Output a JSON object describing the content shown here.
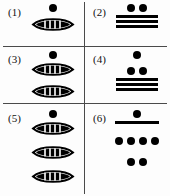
{
  "figure": {
    "background_color": "#fdfdfd",
    "ink_color": "#000000",
    "divider_color": "#4a4a4a",
    "layout": "2 columns x 3 rows grid of labeled Mayan numeral figures"
  },
  "cells": [
    {
      "label": "(1)",
      "name": "cell-1",
      "rows": [
        {
          "type": "dots",
          "count": 1
        },
        {
          "type": "shell",
          "count": 1
        }
      ]
    },
    {
      "label": "(2)",
      "name": "cell-2",
      "rows": [
        {
          "type": "dots",
          "count": 2
        },
        {
          "type": "bars",
          "count": 3
        }
      ]
    },
    {
      "label": "(3)",
      "name": "cell-3",
      "rows": [
        {
          "type": "dots",
          "count": 1
        },
        {
          "type": "shell",
          "count": 1
        },
        {
          "type": "shell",
          "count": 1
        }
      ]
    },
    {
      "label": "(4)",
      "name": "cell-4",
      "rows": [
        {
          "type": "dots",
          "count": 1
        },
        {
          "type": "dots",
          "count": 2
        },
        {
          "type": "bars",
          "count": 3
        }
      ]
    },
    {
      "label": "(5)",
      "name": "cell-5",
      "rows": [
        {
          "type": "dots",
          "count": 1
        },
        {
          "type": "shell",
          "count": 1
        },
        {
          "type": "shell",
          "count": 1
        },
        {
          "type": "shell",
          "count": 1
        }
      ]
    },
    {
      "label": "(6)",
      "name": "cell-6",
      "rows": [
        {
          "type": "dots",
          "count": 1
        },
        {
          "type": "bars",
          "count": 1
        },
        {
          "type": "dots",
          "count": 4
        },
        {
          "type": "dots",
          "count": 2
        }
      ]
    }
  ]
}
